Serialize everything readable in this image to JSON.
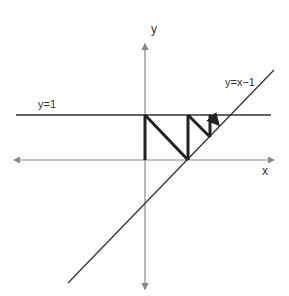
{
  "diagram": {
    "labels": {
      "y_axis": "y",
      "x_axis": "x",
      "horizontal_line": "y=1",
      "diagonal_line": "y=x−1"
    },
    "colors": {
      "axis": "#888888",
      "reference_line": "#333333",
      "cobweb": "#222222",
      "background": "#ffffff"
    },
    "axes": {
      "origin_px": [
        145,
        160
      ],
      "y_axis_px": {
        "x": 145,
        "top": 44,
        "bottom": 289
      },
      "x_axis_px": {
        "y": 160,
        "left": 14,
        "right": 274
      }
    },
    "lines": {
      "y_equals_1_px": {
        "y": 115,
        "left": 16,
        "right": 271
      },
      "y_equals_x_minus_1_px": {
        "x1": 68,
        "y1": 283,
        "x2": 274,
        "y2": 70
      }
    },
    "cobweb_path_px": [
      [
        145,
        160
      ],
      [
        145,
        115
      ],
      [
        188,
        160
      ],
      [
        188,
        115
      ],
      [
        210,
        137
      ],
      [
        210,
        115
      ],
      [
        219,
        125
      ]
    ]
  }
}
